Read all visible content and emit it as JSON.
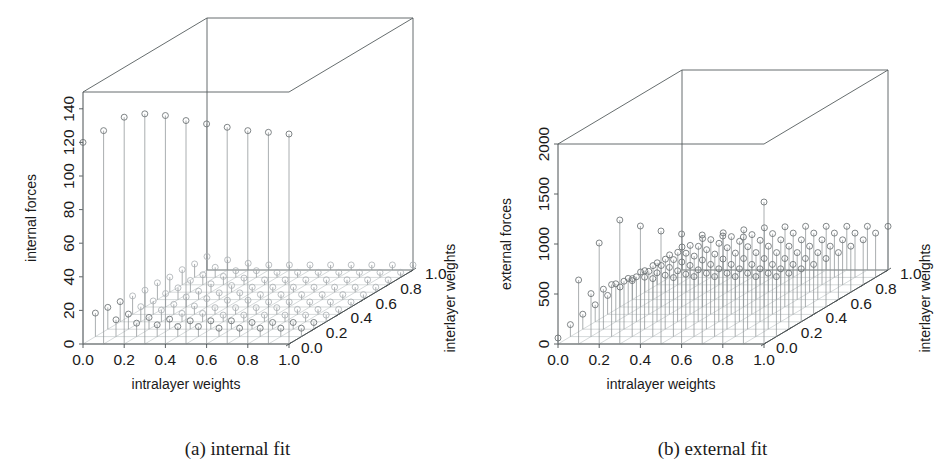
{
  "figure": {
    "panels": [
      {
        "id": "a",
        "caption": "(a) internal fit",
        "zlabel": "internal forces",
        "xlabel": "intralayer weights",
        "ylabel": "interlayer weights",
        "zticks": [
          "0",
          "20",
          "40",
          "60",
          "80",
          "100",
          "120",
          "140"
        ],
        "xticks": [
          "0.0",
          "0.2",
          "0.4",
          "0.6",
          "0.8",
          "1.0"
        ],
        "yticks": [
          "0.0",
          "0.2",
          "0.4",
          "0.6",
          "0.8",
          "1.0"
        ]
      },
      {
        "id": "b",
        "caption": "(b) external fit",
        "zlabel": "external forces",
        "xlabel": "intralayer weights",
        "ylabel": "interlayer weights",
        "zticks": [
          "0",
          "500",
          "1000",
          "1500",
          "2000"
        ],
        "xticks": [
          "0.0",
          "0.2",
          "0.4",
          "0.6",
          "0.8",
          "1.0"
        ],
        "yticks": [
          "0.0",
          "0.2",
          "0.4",
          "0.6",
          "0.8",
          "1.0"
        ]
      }
    ]
  },
  "chart_data": [
    {
      "type": "scatter",
      "subtype": "3d-stem",
      "panel": "a",
      "title": "(a) internal fit",
      "xlabel": "intralayer weights",
      "ylabel": "interlayer weights",
      "zlabel": "internal forces",
      "xlim": [
        0.0,
        1.0
      ],
      "ylim": [
        0.0,
        1.0
      ],
      "zlim": [
        0,
        150
      ],
      "xticks": [
        0.0,
        0.2,
        0.4,
        0.6,
        0.8,
        1.0
      ],
      "yticks": [
        0.0,
        0.2,
        0.4,
        0.6,
        0.8,
        1.0
      ],
      "zticks": [
        0,
        20,
        40,
        60,
        80,
        100,
        120,
        140
      ],
      "grid": true,
      "legend": false,
      "marker": "open-circle",
      "note": "Stem plot over a 10x10 grid of (intralayer, interlayer) weights. Internal forces are near zero over most of the grid and rise steeply only where intralayer weight is small.",
      "x": [
        0.0,
        0.1,
        0.2,
        0.3,
        0.4,
        0.5,
        0.6,
        0.7,
        0.8,
        0.9,
        1.0
      ],
      "y": [
        0.0,
        0.1,
        0.2,
        0.3,
        0.4,
        0.5,
        0.6,
        0.7,
        0.8,
        0.9,
        1.0
      ],
      "z_by_y": [
        {
          "y": 0.0,
          "values": [
            120,
            127,
            135,
            137,
            136,
            133,
            131,
            129,
            127,
            126,
            125
          ]
        },
        {
          "y": 0.1,
          "values": [
            14,
            10,
            8,
            7,
            6,
            6,
            5,
            5,
            5,
            5,
            5
          ]
        },
        {
          "y": 0.2,
          "values": [
            13,
            9,
            7,
            6,
            5,
            5,
            5,
            4,
            4,
            4,
            4
          ]
        },
        {
          "y": 0.3,
          "values": [
            12,
            9,
            7,
            5,
            5,
            4,
            4,
            4,
            4,
            4,
            4
          ]
        },
        {
          "y": 0.4,
          "values": [
            11,
            8,
            6,
            5,
            4,
            4,
            4,
            4,
            3,
            3,
            3
          ]
        },
        {
          "y": 0.5,
          "values": [
            10,
            8,
            6,
            5,
            4,
            4,
            3,
            3,
            3,
            3,
            3
          ]
        },
        {
          "y": 0.6,
          "values": [
            10,
            7,
            5,
            4,
            4,
            3,
            3,
            3,
            3,
            3,
            3
          ]
        },
        {
          "y": 0.7,
          "values": [
            9,
            7,
            5,
            4,
            3,
            3,
            3,
            3,
            3,
            3,
            3
          ]
        },
        {
          "y": 0.8,
          "values": [
            9,
            6,
            5,
            4,
            3,
            3,
            3,
            3,
            3,
            3,
            3
          ]
        },
        {
          "y": 0.9,
          "values": [
            8,
            6,
            4,
            4,
            3,
            3,
            3,
            3,
            3,
            3,
            3
          ]
        },
        {
          "y": 1.0,
          "values": [
            8,
            6,
            4,
            3,
            3,
            3,
            3,
            3,
            3,
            3,
            3
          ]
        }
      ]
    },
    {
      "type": "scatter",
      "subtype": "3d-stem",
      "panel": "b",
      "title": "(b) external fit",
      "xlabel": "intralayer weights",
      "ylabel": "interlayer weights",
      "zlabel": "external forces",
      "xlim": [
        0.0,
        1.0
      ],
      "ylim": [
        0.0,
        1.0
      ],
      "zlim": [
        0,
        2000
      ],
      "xticks": [
        0.0,
        0.2,
        0.4,
        0.6,
        0.8,
        1.0
      ],
      "yticks": [
        0.0,
        0.2,
        0.4,
        0.6,
        0.8,
        1.0
      ],
      "zticks": [
        0,
        500,
        1000,
        1500,
        2000
      ],
      "grid": true,
      "legend": false,
      "marker": "open-circle",
      "note": "Stem plot over a 10x10 grid. External forces stay near 300-600 across most of the grid, with a ridge of taller stems at low interlayer weight.",
      "x": [
        0.0,
        0.1,
        0.2,
        0.3,
        0.4,
        0.5,
        0.6,
        0.7,
        0.8,
        0.9,
        1.0
      ],
      "y": [
        0.0,
        0.1,
        0.2,
        0.3,
        0.4,
        0.5,
        0.6,
        0.7,
        0.8,
        0.9,
        1.0
      ],
      "z_by_y": [
        {
          "y": 0.0,
          "values": [
            60,
            640,
            1010,
            1240,
            1180,
            1130,
            1100,
            1090,
            1080,
            1070,
            1420
          ]
        },
        {
          "y": 0.1,
          "values": [
            120,
            430,
            520,
            560,
            580,
            590,
            600,
            600,
            600,
            600,
            600
          ]
        },
        {
          "y": 0.2,
          "values": [
            150,
            400,
            480,
            520,
            540,
            550,
            560,
            560,
            560,
            560,
            560
          ]
        },
        {
          "y": 0.3,
          "values": [
            170,
            380,
            450,
            490,
            510,
            520,
            530,
            530,
            530,
            530,
            530
          ]
        },
        {
          "y": 0.4,
          "values": [
            190,
            360,
            430,
            470,
            490,
            500,
            500,
            500,
            500,
            500,
            500
          ]
        },
        {
          "y": 0.5,
          "values": [
            200,
            350,
            415,
            450,
            470,
            480,
            485,
            485,
            485,
            485,
            485
          ]
        },
        {
          "y": 0.6,
          "values": [
            210,
            340,
            400,
            435,
            455,
            465,
            470,
            470,
            470,
            470,
            470
          ]
        },
        {
          "y": 0.7,
          "values": [
            215,
            330,
            390,
            425,
            445,
            455,
            460,
            460,
            460,
            460,
            460
          ]
        },
        {
          "y": 0.8,
          "values": [
            220,
            325,
            385,
            415,
            435,
            445,
            450,
            450,
            450,
            450,
            450
          ]
        },
        {
          "y": 0.9,
          "values": [
            225,
            320,
            378,
            408,
            428,
            438,
            443,
            443,
            443,
            443,
            443
          ]
        },
        {
          "y": 1.0,
          "values": [
            230,
            315,
            372,
            402,
            422,
            432,
            437,
            437,
            437,
            437,
            437
          ]
        }
      ]
    }
  ]
}
